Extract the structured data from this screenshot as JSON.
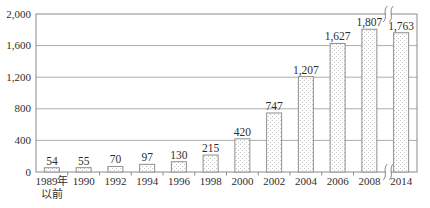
{
  "chart_data": {
    "type": "bar",
    "title": "",
    "xlabel": "",
    "ylabel": "",
    "categories": [
      "1989年以前",
      "1990",
      "1992",
      "1994",
      "1996",
      "1998",
      "2000",
      "2002",
      "2004",
      "2006",
      "2008",
      "2014"
    ],
    "category_lines": [
      [
        "1989年",
        "以前"
      ],
      [
        "1990"
      ],
      [
        "1992"
      ],
      [
        "1994"
      ],
      [
        "1996"
      ],
      [
        "1998"
      ],
      [
        "2000"
      ],
      [
        "2002"
      ],
      [
        "2004"
      ],
      [
        "2006"
      ],
      [
        "2008"
      ],
      [
        "2014"
      ]
    ],
    "values": [
      54,
      55,
      70,
      97,
      130,
      215,
      420,
      747,
      1207,
      1627,
      1807,
      1763
    ],
    "value_labels": [
      "54",
      "55",
      "70",
      "97",
      "130",
      "215",
      "420",
      "747",
      "1,207",
      "1,627",
      "1,807",
      "1,763"
    ],
    "ylim": [
      0,
      2000
    ],
    "ytick_values": [
      0,
      400,
      800,
      1200,
      1600,
      2000
    ],
    "ytick_labels": [
      "0",
      "400",
      "800",
      "1,200",
      "1,600",
      "2,000"
    ],
    "grid": true,
    "legend": "none",
    "bar_fill_style": "dotted-stipple",
    "axis_break": {
      "between": [
        "2008",
        "2014"
      ],
      "boundary_index": 11,
      "marks": [
        "top-right",
        "bottom-right"
      ]
    },
    "colors": {
      "background": "#ffffff",
      "axis": "#8a8a8a",
      "grid": "#adadad",
      "bar_stroke": "#8f8f8f",
      "bar_fill": "#ffffff",
      "bar_dot": "#c4c4c4",
      "text": "#2e2e2e"
    }
  }
}
